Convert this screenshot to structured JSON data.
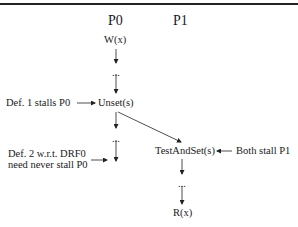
{
  "diagram": {
    "processors": [
      {
        "label": "P0"
      },
      {
        "label": "P1"
      }
    ],
    "nodes": {
      "p0_write": "W(x)",
      "p0_ellipsis1": "...",
      "p0_unset": "Unset(s)",
      "p0_ellipsis2": "...",
      "p1_testandset": "TestAndSet(s)",
      "p1_ellipsis": "...",
      "p1_read": "R(x)"
    },
    "annotations": {
      "def1": "Def. 1 stalls P0",
      "def2_line1": "Def. 2 w.r.t. DRF0",
      "def2_line2": "need never stall P0",
      "both": "Both stall P1"
    },
    "colors": {
      "line": "#222222",
      "text": "#1a1a1a",
      "background": "#ffffff"
    }
  }
}
